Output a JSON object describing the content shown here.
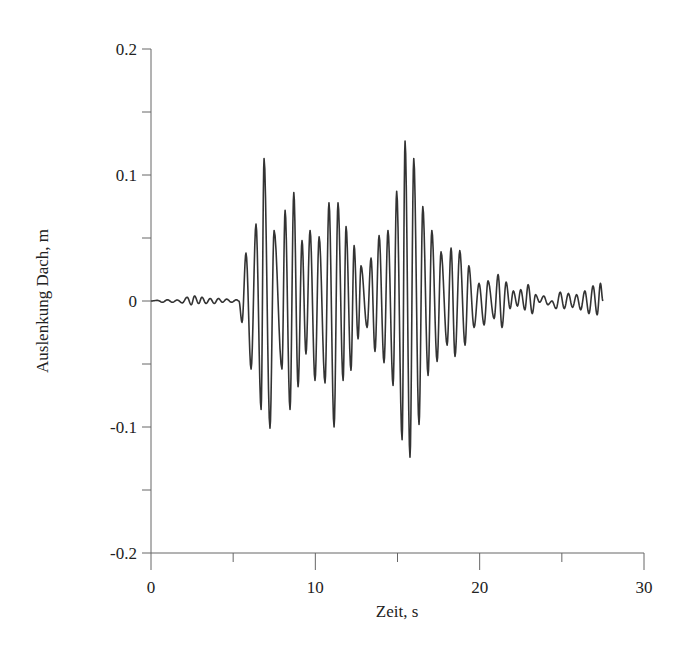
{
  "chart_data": {
    "type": "line",
    "title": "",
    "xlabel": "Zeit, s",
    "ylabel": "Auslenkung Dach, m",
    "xlim": [
      0,
      30
    ],
    "ylim": [
      -0.2,
      0.2
    ],
    "x_ticks": [
      0,
      10,
      20,
      30
    ],
    "x_tick_labels": [
      "0",
      "10",
      "20",
      "30"
    ],
    "x_minor_ticks": [
      5,
      15,
      25
    ],
    "y_ticks": [
      0.2,
      0.1,
      0,
      -0.1,
      -0.2
    ],
    "y_tick_labels": [
      "0.2",
      "0.1",
      "0",
      "-0.1",
      "-0.2"
    ],
    "y_minor_ticks": [
      0.15,
      0.05,
      -0.05,
      -0.15
    ],
    "grid": false,
    "legend": null,
    "series": [
      {
        "name": "Auslenkung Dach",
        "color": "#333333",
        "points": [
          [
            0.0,
            0.0
          ],
          [
            0.4,
            0.0005
          ],
          [
            0.7,
            -0.001
          ],
          [
            1.0,
            0.001
          ],
          [
            1.3,
            -0.001
          ],
          [
            1.6,
            0.0008
          ],
          [
            1.9,
            -0.0015
          ],
          [
            2.2,
            0.003
          ],
          [
            2.45,
            -0.003
          ],
          [
            2.65,
            0.004
          ],
          [
            2.9,
            -0.002
          ],
          [
            3.1,
            0.003
          ],
          [
            3.35,
            -0.002
          ],
          [
            3.6,
            0.002
          ],
          [
            3.85,
            -0.002
          ],
          [
            4.1,
            0.002
          ],
          [
            4.35,
            -0.001
          ],
          [
            4.6,
            0.0015
          ],
          [
            4.9,
            -0.001
          ],
          [
            5.2,
            0.001
          ],
          [
            5.35,
            0.0
          ],
          [
            5.54,
            -0.017
          ],
          [
            5.78,
            0.038
          ],
          [
            6.09,
            -0.054
          ],
          [
            6.39,
            0.061
          ],
          [
            6.7,
            -0.086
          ],
          [
            6.88,
            0.113
          ],
          [
            7.24,
            -0.101
          ],
          [
            7.49,
            0.056
          ],
          [
            7.97,
            -0.054
          ],
          [
            8.16,
            0.072
          ],
          [
            8.46,
            -0.086
          ],
          [
            8.69,
            0.086
          ],
          [
            8.95,
            -0.068
          ],
          [
            9.19,
            0.048
          ],
          [
            9.43,
            -0.042
          ],
          [
            9.68,
            0.056
          ],
          [
            9.98,
            -0.063
          ],
          [
            10.23,
            0.051
          ],
          [
            10.59,
            -0.065
          ],
          [
            10.83,
            0.078
          ],
          [
            11.14,
            -0.1
          ],
          [
            11.38,
            0.078
          ],
          [
            11.69,
            -0.063
          ],
          [
            11.87,
            0.059
          ],
          [
            12.17,
            -0.055
          ],
          [
            12.36,
            0.044
          ],
          [
            12.6,
            -0.03
          ],
          [
            12.78,
            0.028
          ],
          [
            13.15,
            -0.021
          ],
          [
            13.39,
            0.034
          ],
          [
            13.63,
            -0.04
          ],
          [
            13.88,
            0.052
          ],
          [
            14.18,
            -0.049
          ],
          [
            14.42,
            0.056
          ],
          [
            14.73,
            -0.067
          ],
          [
            14.95,
            0.087
          ],
          [
            15.28,
            -0.11
          ],
          [
            15.46,
            0.127
          ],
          [
            15.76,
            -0.124
          ],
          [
            15.99,
            0.113
          ],
          [
            16.31,
            -0.098
          ],
          [
            16.54,
            0.075
          ],
          [
            16.86,
            -0.059
          ],
          [
            17.09,
            0.056
          ],
          [
            17.41,
            -0.048
          ],
          [
            17.65,
            0.039
          ],
          [
            18.02,
            -0.035
          ],
          [
            18.26,
            0.042
          ],
          [
            18.5,
            -0.044
          ],
          [
            18.79,
            0.04
          ],
          [
            19.11,
            -0.035
          ],
          [
            19.34,
            0.028
          ],
          [
            19.66,
            -0.021
          ],
          [
            19.96,
            0.014
          ],
          [
            20.27,
            -0.019
          ],
          [
            20.51,
            0.016
          ],
          [
            20.88,
            -0.014
          ],
          [
            21.12,
            0.021
          ],
          [
            21.36,
            -0.021
          ],
          [
            21.61,
            0.015
          ],
          [
            21.85,
            -0.006
          ],
          [
            22.05,
            0.008
          ],
          [
            22.3,
            -0.004
          ],
          [
            22.5,
            0.009
          ],
          [
            22.75,
            -0.007
          ],
          [
            22.95,
            0.013
          ],
          [
            23.2,
            -0.01
          ],
          [
            23.4,
            0.005
          ],
          [
            23.65,
            -0.001
          ],
          [
            23.9,
            0.004
          ],
          [
            24.15,
            -0.003
          ],
          [
            24.4,
            0.0
          ],
          [
            24.65,
            -0.006
          ],
          [
            24.9,
            0.007
          ],
          [
            25.15,
            -0.006
          ],
          [
            25.4,
            0.006
          ],
          [
            25.65,
            -0.005
          ],
          [
            25.9,
            0.005
          ],
          [
            26.15,
            -0.007
          ],
          [
            26.4,
            0.008
          ],
          [
            26.65,
            -0.01
          ],
          [
            26.9,
            0.012
          ],
          [
            27.15,
            -0.011
          ],
          [
            27.35,
            0.014
          ],
          [
            27.5,
            0.0
          ]
        ]
      }
    ]
  }
}
